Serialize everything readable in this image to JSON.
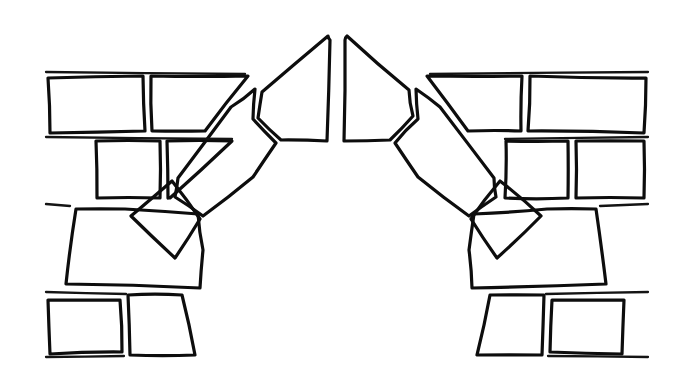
{
  "drawing": {
    "title": "Pointed Arch Masonry Line Drawing",
    "subject": "gothic-pointed-arch",
    "medium": "black-ink-line-art",
    "background_color": "#ffffff",
    "stroke_color": "#0d0d0d",
    "stroke_width": 3.2,
    "canvas": {
      "width": 681,
      "height": 382
    },
    "caption": "",
    "label": ""
  },
  "chart_data": {
    "type": "diagram",
    "stroke_color": "#0d0d0d",
    "background_color": "#ffffff",
    "apex": {
      "x": 336,
      "y": 33
    },
    "springing_level_y": 212,
    "wall_courses_y": [
      72,
      136,
      203,
      290,
      356
    ],
    "left_wall_edge_x": 46,
    "right_wall_edge_x": 648,
    "element_counts": {
      "voussoirs_left": 4,
      "voussoirs_right": 4,
      "springers": 2,
      "impost_blocks": 2,
      "wall_stones": 14
    },
    "shapes": [
      {
        "name": "keystone-left",
        "group": "arch",
        "role": "voussoir",
        "points": "328,36 262,92 258,118 281,140 327,141 330,40"
      },
      {
        "name": "keystone-right",
        "group": "arch",
        "role": "voussoir",
        "points": "345,40 344,141 390,140 413,116 409,90 347,36"
      },
      {
        "name": "voussoir-left-2",
        "group": "arch",
        "role": "voussoir",
        "points": "255,89 231,107 178,178 175,197 203,216 253,177 276,143 253,119"
      },
      {
        "name": "voussoir-right-2",
        "group": "arch",
        "role": "voussoir",
        "points": "416,89 440,107 494,178 496,197 469,216 418,177 395,143 418,119"
      },
      {
        "name": "voussoir-left-3",
        "group": "arch",
        "role": "voussoir-lower",
        "points": "172,181 131,216 175,258 200,219"
      },
      {
        "name": "voussoir-right-3",
        "group": "arch",
        "role": "voussoir-lower",
        "points": "500,181 541,216 497,258 471,219"
      },
      {
        "name": "springer-left",
        "group": "arch",
        "role": "springer",
        "points": "76,209 66,284 200,288 203,250 198,214 125,209"
      },
      {
        "name": "springer-right",
        "group": "arch",
        "role": "springer",
        "points": "596,209 606,284 472,288 469,250 474,214 547,209"
      },
      {
        "name": "impost-left",
        "group": "arch",
        "role": "impost-block",
        "points": "128,295 182,295 195,355 130,355"
      },
      {
        "name": "impost-right",
        "group": "arch",
        "role": "impost-block",
        "points": "544,295 490,295 477,355 542,355"
      },
      {
        "name": "wall-stone-upper-left-a",
        "group": "wall-left",
        "role": "wall-stone",
        "points": "48,78 143,76 145,131 50,133"
      },
      {
        "name": "wall-stone-upper-left-b",
        "group": "wall-left",
        "role": "wall-stone",
        "points": "151,76 248,76 205,131 152,131"
      },
      {
        "name": "wall-stone-mid-left-a",
        "group": "wall-left",
        "role": "wall-stone",
        "points": "96,141 160,141 160,198 97,198"
      },
      {
        "name": "wall-stone-mid-left-b",
        "group": "wall-left",
        "role": "wall-stone",
        "points": "167,141 232,141 170,198 168,198"
      },
      {
        "name": "wall-stone-lower-left-a",
        "group": "wall-left",
        "role": "wall-stone",
        "points": "48,300 120,300 122,352 50,354"
      },
      {
        "name": "wall-stone-upper-right-a",
        "group": "wall-right",
        "role": "wall-stone",
        "points": "646,78 530,76 528,131 644,133"
      },
      {
        "name": "wall-stone-upper-right-b",
        "group": "wall-right",
        "role": "wall-stone",
        "points": "522,76 427,76 468,131 521,131"
      },
      {
        "name": "wall-stone-mid-right-a",
        "group": "wall-right",
        "role": "wall-stone",
        "points": "576,141 644,141 644,198 576,198"
      },
      {
        "name": "wall-stone-mid-right-b",
        "group": "wall-right",
        "role": "wall-stone",
        "points": "506,141 568,141 568,198 505,198"
      },
      {
        "name": "wall-stone-lower-right-a",
        "group": "wall-right",
        "role": "wall-stone",
        "points": "624,300 552,300 550,352 622,354"
      }
    ],
    "open_mortar_lines": [
      {
        "name": "course-line-top-left",
        "points": "46,72 245,74"
      },
      {
        "name": "course-line-top-right",
        "points": "648,72 430,74"
      },
      {
        "name": "course-line-mid-left",
        "points": "46,137 232,139"
      },
      {
        "name": "course-line-mid-right",
        "points": "648,137 505,139"
      },
      {
        "name": "course-line-bottom-left",
        "points": "46,204 70,206"
      },
      {
        "name": "course-line-bottom-right",
        "points": "648,204 600,206"
      },
      {
        "name": "course-line-base-left",
        "points": "46,292 126,294"
      },
      {
        "name": "course-line-base-right",
        "points": "648,292 546,294"
      },
      {
        "name": "course-line-foot-left",
        "points": "46,357 124,356"
      },
      {
        "name": "course-line-foot-right",
        "points": "648,357 548,356"
      }
    ]
  }
}
